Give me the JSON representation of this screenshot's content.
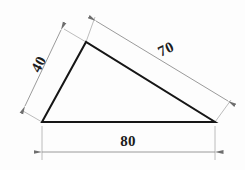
{
  "drawing": {
    "title": "Triangle with dimensions",
    "background_color": "#fdfdfd",
    "shape_stroke_color": "#161616",
    "dimension_stroke_color": "#9a9a9a",
    "label_color": "#1c1c1c",
    "shape": {
      "type": "triangle",
      "vertices": [
        {
          "name": "bottom-left",
          "x": 42,
          "y": 122
        },
        {
          "name": "apex",
          "x": 86,
          "y": 42
        },
        {
          "name": "bottom-right",
          "x": 215,
          "y": 122
        }
      ]
    },
    "dimensions": [
      {
        "id": "base",
        "value": "80",
        "orientation": "horizontal",
        "side": "bottom",
        "measures": "bottom-left to bottom-right",
        "rotation_deg": 0
      },
      {
        "id": "left-side",
        "value": "40",
        "orientation": "oblique",
        "side": "left",
        "measures": "bottom-left to apex",
        "rotation_deg": -62
      },
      {
        "id": "hypotenuse",
        "value": "70",
        "orientation": "oblique",
        "side": "upper-right",
        "measures": "apex to bottom-right",
        "rotation_deg": -25
      }
    ]
  }
}
